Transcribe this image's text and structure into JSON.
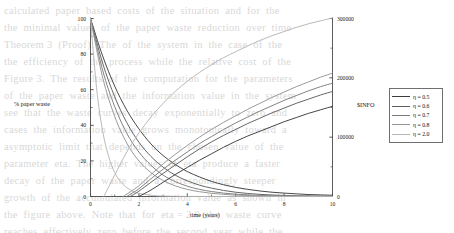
{
  "chart_data": {
    "type": "line",
    "title": "",
    "xlabel": "time (years)",
    "ylabel": "% paper waste",
    "ylabel_right": "$INFO",
    "xlim": [
      0,
      10
    ],
    "ylim": [
      0,
      100
    ],
    "ylim_right": [
      0,
      300000
    ],
    "xticks": [
      "0",
      "2",
      "4",
      "6",
      "8",
      "10"
    ],
    "xtick_values": [
      0,
      2,
      4,
      6,
      8,
      10
    ],
    "yticks_left": [
      "0",
      "20",
      "40",
      "60",
      "80",
      "100"
    ],
    "ytick_left_values": [
      0,
      20,
      40,
      60,
      80,
      100
    ],
    "yticks_right": [
      "0",
      "100000",
      "200000",
      "300000"
    ],
    "ytick_right_values": [
      0,
      100000,
      200000,
      300000
    ],
    "grid": false,
    "legend_position": "right-middle",
    "legend_entries": [
      "η = 0.5",
      "η = 0.6",
      "η = 0.7",
      "η = 0.8",
      "η = 2.0"
    ],
    "series": [
      {
        "name": "η = 0.5",
        "group": "paper-waste",
        "axis": "left",
        "color": "#3d3d3d",
        "x": [
          0,
          0.5,
          1,
          1.5,
          2,
          2.5,
          3,
          3.5,
          4,
          4.5,
          5,
          5.5,
          6,
          6.5,
          7,
          7.5,
          8,
          8.5,
          9,
          9.5,
          10
        ],
        "values": [
          100,
          79,
          62,
          48.5,
          38,
          29.5,
          23,
          18,
          14,
          11,
          8.5,
          6.6,
          5.1,
          4.0,
          3.1,
          2.4,
          1.9,
          1.5,
          1.1,
          0.9,
          0.7
        ]
      },
      {
        "name": "η = 0.6",
        "group": "paper-waste",
        "axis": "left",
        "color": "#5e5e5e",
        "x": [
          0,
          0.5,
          1,
          1.5,
          2,
          2.5,
          3,
          3.5,
          4,
          4.5,
          5,
          5.5,
          6,
          6.5,
          7,
          7.5,
          8,
          8.5,
          9,
          9.5,
          10
        ],
        "values": [
          100,
          75,
          56,
          41.5,
          30.5,
          22.5,
          16.5,
          12,
          8.8,
          6.4,
          4.7,
          3.4,
          2.4,
          1.7,
          1.2,
          0.85,
          0.6,
          0.42,
          0.3,
          0.21,
          0.15
        ]
      },
      {
        "name": "η = 0.7",
        "group": "paper-waste",
        "axis": "left",
        "color": "#7b7b7b",
        "x": [
          0,
          0.5,
          1,
          1.5,
          2,
          2.5,
          3,
          3.5,
          4,
          4.5,
          5,
          5.5,
          6,
          6.5,
          7,
          7.5,
          8,
          8.5,
          9,
          9.5,
          10
        ],
        "values": [
          100,
          71,
          50.5,
          35.5,
          25,
          17.5,
          12,
          8.4,
          5.8,
          4.0,
          2.8,
          1.9,
          1.3,
          0.9,
          0.62,
          0.42,
          0.28,
          0.19,
          0.13,
          0.09,
          0.06
        ]
      },
      {
        "name": "η = 0.8",
        "group": "paper-waste",
        "axis": "left",
        "color": "#949494",
        "x": [
          0,
          0.5,
          1,
          1.5,
          2,
          2.5,
          3,
          3.5,
          4,
          4.5,
          5,
          5.5,
          6,
          6.5,
          7,
          7.5,
          8,
          8.5,
          9,
          9.5,
          10
        ],
        "values": [
          100,
          67,
          45,
          30,
          20,
          13.4,
          9,
          6,
          4,
          2.7,
          1.8,
          1.2,
          0.8,
          0.53,
          0.35,
          0.23,
          0.16,
          0.1,
          0.07,
          0.045,
          0.03
        ]
      },
      {
        "name": "η = 2.0",
        "group": "paper-waste",
        "axis": "left",
        "color": "#b5b5b5",
        "x": [
          0,
          0.25,
          0.5,
          0.75,
          1,
          1.25,
          1.5,
          1.75,
          2,
          2.5,
          3,
          4,
          5,
          6,
          7,
          8,
          9,
          10
        ],
        "values": [
          100,
          61,
          37,
          22.5,
          13.5,
          8.2,
          5.0,
          3.0,
          1.8,
          0.7,
          0.25,
          0.03,
          0,
          0,
          0,
          0,
          0,
          0
        ]
      },
      {
        "name": "η = 0.5",
        "group": "info",
        "axis": "right",
        "color": "#3d3d3d",
        "x": [
          2.0,
          2.5,
          3,
          3.5,
          4,
          4.5,
          5,
          5.5,
          6,
          6.5,
          7,
          7.5,
          8,
          8.5,
          9,
          9.5,
          10
        ],
        "values": [
          0,
          11000,
          24000,
          37000,
          49000,
          61000,
          72000,
          83000,
          93000,
          102000,
          110000,
          118000,
          126000,
          133000,
          140000,
          146000,
          152000
        ]
      },
      {
        "name": "η = 0.6",
        "group": "info",
        "axis": "right",
        "color": "#5e5e5e",
        "x": [
          1.65,
          2,
          2.5,
          3,
          3.5,
          4,
          4.5,
          5,
          5.5,
          6,
          6.5,
          7,
          7.5,
          8,
          8.5,
          9,
          9.5,
          10
        ],
        "values": [
          0,
          9000,
          24000,
          39000,
          53000,
          67000,
          80000,
          92000,
          103000,
          113000,
          123000,
          132000,
          141000,
          149000,
          157000,
          164000,
          171000,
          177000
        ]
      },
      {
        "name": "η = 0.7",
        "group": "info",
        "axis": "right",
        "color": "#7b7b7b",
        "x": [
          1.5,
          2,
          2.5,
          3,
          3.5,
          4,
          4.5,
          5,
          5.5,
          6,
          6.5,
          7,
          7.5,
          8,
          8.5,
          9,
          9.5,
          10
        ],
        "values": [
          0,
          13000,
          30000,
          46000,
          61000,
          75000,
          89000,
          101000,
          113000,
          124000,
          134000,
          144000,
          153000,
          162000,
          170000,
          178000,
          185000,
          191000
        ]
      },
      {
        "name": "η = 0.8",
        "group": "info",
        "axis": "right",
        "color": "#949494",
        "x": [
          1.35,
          2,
          2.5,
          3,
          3.5,
          4,
          4.5,
          5,
          5.5,
          6,
          6.5,
          7,
          7.5,
          8,
          8.5,
          9,
          9.5,
          10
        ],
        "values": [
          0,
          18000,
          37000,
          55000,
          71000,
          86000,
          100000,
          113000,
          125000,
          136000,
          147000,
          157000,
          167000,
          176000,
          185000,
          193000,
          201000,
          208000
        ]
      },
      {
        "name": "η = 2.0",
        "group": "info",
        "axis": "right",
        "color": "#b5b5b5",
        "x": [
          0.55,
          1,
          1.5,
          2,
          2.5,
          3,
          3.5,
          4,
          4.5,
          5,
          5.5,
          6,
          6.5,
          7,
          7.5,
          8,
          8.5,
          9,
          9.5,
          10
        ],
        "values": [
          0,
          36000,
          75000,
          107000,
          134000,
          157000,
          177000,
          194000,
          209000,
          222000,
          234000,
          244000,
          254000,
          263000,
          271000,
          278000,
          285000,
          291000,
          296000,
          301000
        ]
      }
    ]
  },
  "legend": {
    "entries": [
      {
        "label": "η = 0.5",
        "color": "#3d3d3d"
      },
      {
        "label": "η = 0.6",
        "color": "#5e5e5e"
      },
      {
        "label": "η = 0.7",
        "color": "#7b7b7b"
      },
      {
        "label": "η = 0.8",
        "color": "#949494"
      },
      {
        "label": "η = 2.0",
        "color": "#b5b5b5"
      }
    ]
  },
  "axes": {
    "left_title": "% paper waste",
    "right_title": "$INFO",
    "bottom_title": "time (years)"
  },
  "background_text": {
    "lines": [
      "calculated  paper  based  costs  of  the  situation  and  for  the",
      "the  minimal  values  of  the  paper  waste  reduction  over  time",
      "Theorem 3  (Proof).  The  of  the  system  in  the  case  of  the",
      "the  efficiency  of  the  process  while  the  relative  cost  of  the",
      "Figure 3.  The  results  of  the  computation  for  the  parameters",
      "of  the  paper  waste  and  the  information  value  in  the  system",
      "see  that  the  waste  curves  decay  exponentially  to  zero  and",
      "cases  the  information  value  grows  monotonically  toward  a",
      "asymptotic  limit  that  depends  on  the  chosen  value  of  the",
      "parameter  eta.  The  higher  values  of  eta  produce  a  faster",
      "decay  of  the  paper  waste  and  a  correspondingly  steeper",
      "growth  of  the  accumulated  information  value  as  shown  in",
      "the  figure  above.  Note  that  for  eta = 2.0  the  waste  curve",
      "reaches  effectively  zero  before  the  second  year  while  the"
    ]
  }
}
